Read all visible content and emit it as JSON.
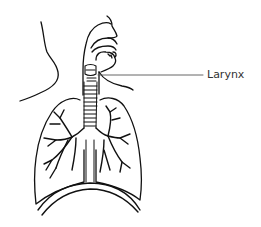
{
  "diagram": {
    "labels": [
      {
        "text": "Larynx",
        "x": 208,
        "y": 69
      }
    ],
    "colors": {
      "line": "#111111",
      "label_text": "#333333",
      "leader_line": "#555555",
      "background": "#ffffff"
    }
  }
}
